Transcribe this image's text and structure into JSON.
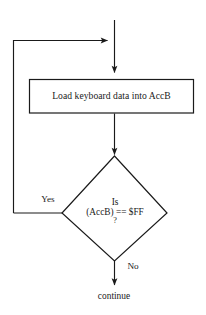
{
  "diagram": {
    "type": "flowchart",
    "background_color": "#ffffff",
    "stroke_color": "#1a1a1a",
    "text_color": "#1a1a1a",
    "nodes": {
      "process": {
        "shape": "rectangle",
        "label": "Load keyboard data into AccB"
      },
      "decision": {
        "shape": "diamond",
        "line1": "Is",
        "line2": "(AccB) == $FF",
        "line3": "?"
      },
      "terminal": {
        "shape": "text",
        "label": "continue"
      }
    },
    "edges": {
      "yes_branch_label": "Yes",
      "no_branch_label": "No"
    }
  }
}
